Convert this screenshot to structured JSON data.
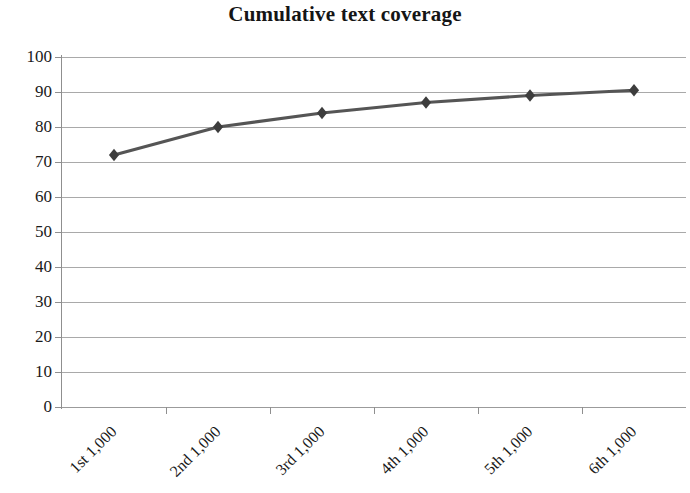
{
  "chart_data": {
    "type": "line",
    "title": "Cumulative text coverage",
    "xlabel": "",
    "ylabel": "",
    "categories": [
      "1st 1,000",
      "2nd 1,000",
      "3rd 1,000",
      "4th 1,000",
      "5th 1,000",
      "6th 1,000"
    ],
    "values": [
      72,
      80,
      84,
      87,
      89,
      90.5
    ],
    "series": [
      {
        "name": "Cumulative text coverage",
        "values": [
          72,
          80,
          84,
          87,
          89,
          90.5
        ]
      }
    ],
    "ylim": [
      0,
      100
    ],
    "y_ticks": [
      0,
      10,
      20,
      30,
      40,
      50,
      60,
      70,
      80,
      90,
      100
    ],
    "y_tick_labels": [
      "0",
      "10",
      "20",
      "30",
      "40",
      "50",
      "60",
      "70",
      "80",
      "90",
      "100"
    ],
    "grid": true,
    "grid_axis": "y",
    "legend": false,
    "legend_position": "none",
    "marker": "diamond",
    "line_color": "#555555",
    "marker_color": "#3d3d3d",
    "grid_color": "#9a9a9a",
    "axis_color": "#8f8f8f",
    "text_color": "#1a1a1a",
    "x_tick_label_rotation": -45
  }
}
